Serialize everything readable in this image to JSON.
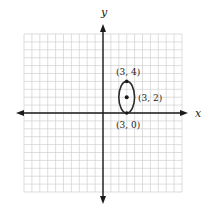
{
  "chart_data": {
    "type": "scatter",
    "title": "",
    "xlabel": "x",
    "ylabel": "y",
    "xlim": [
      -10,
      10
    ],
    "ylim": [
      -10,
      10
    ],
    "grid": true,
    "shapes": [
      {
        "type": "ellipse",
        "center": [
          3,
          2
        ],
        "semi_axis_x": 1,
        "semi_axis_y": 2,
        "equation": "(x-3)^2/1 + (y-2)^2/4 = 1"
      }
    ],
    "points": [
      {
        "x": 3,
        "y": 4,
        "label": "(3, 4)"
      },
      {
        "x": 3,
        "y": 2,
        "label": "(3, 2)"
      },
      {
        "x": 3,
        "y": 0,
        "label": "(3, 0)"
      }
    ]
  },
  "axes": {
    "x_label": "x",
    "y_label": "y"
  },
  "labels": {
    "top": "(3, 4)",
    "center": "(3, 2)",
    "bottom": "(3, 0)"
  },
  "colors": {
    "grid": "#c8c8c8",
    "axis": "#1a1a1a",
    "curve": "#2a2a2a"
  }
}
